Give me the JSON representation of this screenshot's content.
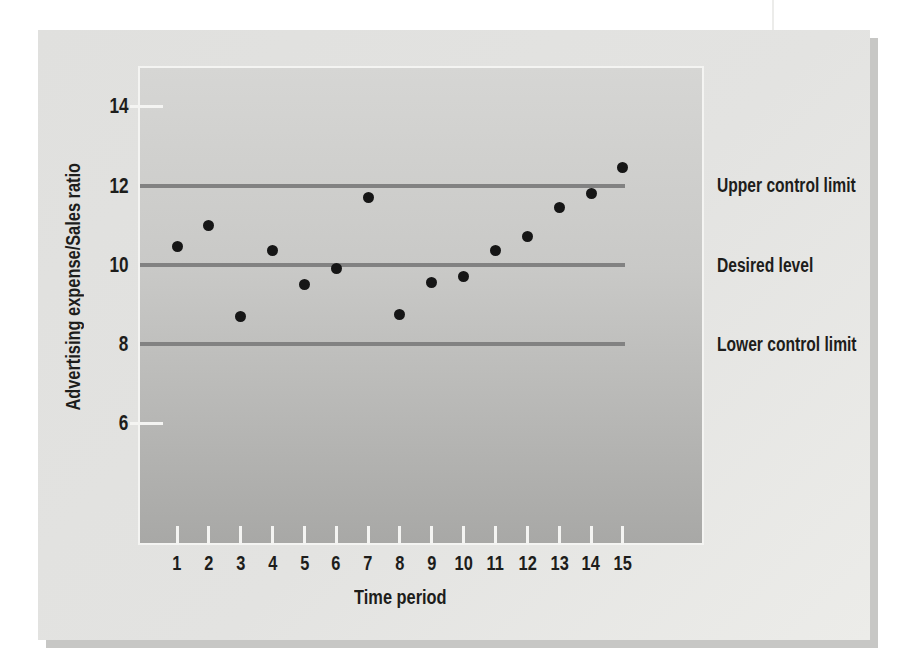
{
  "figure": {
    "kind": "control-chart",
    "x_axis_title": "Time period",
    "y_axis_title": "Advertising expense/Sales ratio"
  },
  "chart_data": {
    "type": "scatter",
    "title": "",
    "xlabel": "Time period",
    "ylabel": "Advertising expense/Sales ratio",
    "x": [
      1,
      2,
      3,
      4,
      5,
      6,
      7,
      8,
      9,
      10,
      11,
      12,
      13,
      14,
      15
    ],
    "values": [
      10.45,
      11.0,
      8.7,
      10.35,
      9.5,
      9.9,
      11.7,
      8.75,
      9.55,
      9.7,
      10.35,
      10.7,
      11.45,
      11.8,
      12.45
    ],
    "marker": "filled-circle",
    "grid": false,
    "legend": "none",
    "xlim": [
      0,
      16
    ],
    "ylim": [
      4.6,
      15.2
    ],
    "ytick_values": [
      14,
      12,
      10,
      8,
      6
    ],
    "ytick_labels": [
      "14",
      "12",
      "10",
      "8",
      "6"
    ],
    "ytick_dash_values": [
      14,
      6
    ],
    "reference_lines": [
      {
        "value": 12,
        "label": "Upper control limit"
      },
      {
        "value": 10,
        "label": "Desired level"
      },
      {
        "value": 8,
        "label": "Lower control limit"
      }
    ],
    "annotation_position": "right"
  },
  "colors": {
    "card_background": "#e2e2e0",
    "plot_top": "#d6d6d4",
    "plot_bottom": "#a8a8a6",
    "reference_line": "#828282",
    "data_point": "#161616",
    "tick_mark": "#f4f4f2",
    "text": "#1d1d1b",
    "card_shadow": "#c7c7c5"
  }
}
